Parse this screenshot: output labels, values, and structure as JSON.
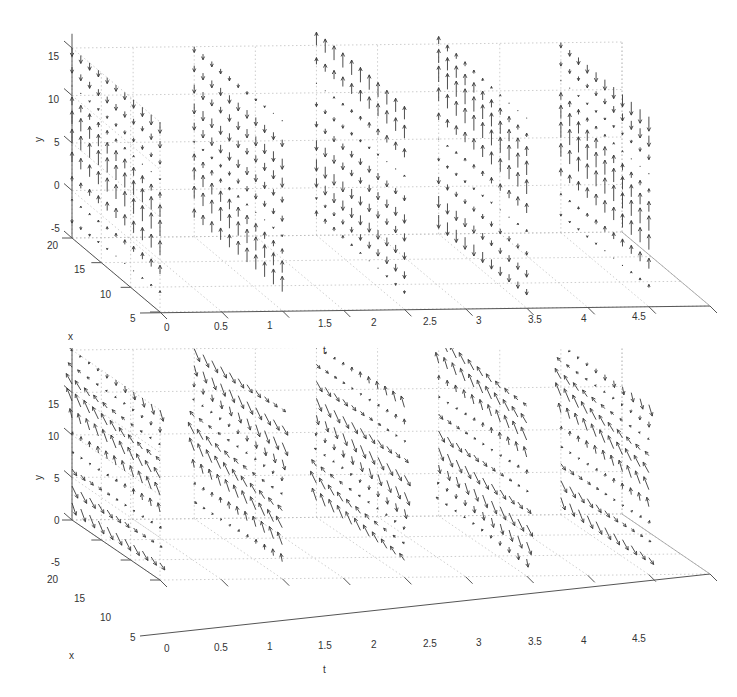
{
  "chart_data": [
    {
      "type": "quiver3d",
      "title": "",
      "panel": "top",
      "xlabel": "t",
      "ylabel": "y",
      "zlabel": "x",
      "t_ticks": [
        "0",
        "0.5",
        "1",
        "1.5",
        "2",
        "2.5",
        "3",
        "3.5",
        "4",
        "4.5"
      ],
      "y_ticks": [
        "15",
        "10",
        "5",
        "0",
        "-5"
      ],
      "x_ticks": [
        "20",
        "15",
        "10",
        "5"
      ],
      "t_range": [
        0,
        4.5
      ],
      "y_range": [
        -5,
        15
      ],
      "x_range": [
        5,
        20
      ],
      "grid": true,
      "slices_t": [
        0,
        1,
        2,
        3,
        4
      ],
      "grid_x": [
        5,
        6.5,
        8,
        9.5,
        11,
        12.5,
        14,
        15.5,
        17,
        18.5,
        20
      ],
      "grid_y": [
        -3,
        -1,
        1,
        3,
        5,
        7,
        9,
        11,
        13,
        15
      ],
      "description": "Vector field samples on 5 vertical slices; arrows vertical, predominantly upward at t=0 and progressively downward (more negative) by t=3-4, with downward region growing toward lower y and front x.",
      "phase_shift_per_slice": 0.9
    },
    {
      "type": "quiver3d",
      "title": "",
      "panel": "bottom",
      "xlabel": "t",
      "ylabel": "y",
      "zlabel": "x",
      "t_ticks": [
        "0",
        "0.5",
        "1",
        "1.5",
        "2",
        "2.5",
        "3",
        "3.5",
        "4",
        "4.5"
      ],
      "y_ticks": [
        "15",
        "10",
        "5",
        "0",
        "-5"
      ],
      "x_ticks": [
        "20",
        "15",
        "10",
        "5"
      ],
      "t_range": [
        0,
        4.5
      ],
      "y_range": [
        -5,
        15
      ],
      "x_range": [
        5,
        20
      ],
      "grid": true,
      "slices_t": [
        0,
        1,
        2,
        3,
        4
      ],
      "grid_x": [
        5,
        6.5,
        8,
        9.5,
        11,
        12.5,
        14,
        15.5,
        17,
        18.5,
        20
      ],
      "grid_y": [
        -3,
        -1,
        1,
        3,
        5,
        7,
        9,
        11,
        13,
        15
      ],
      "description": "Vector field samples on 5 vertical slices with horizontal (x) and vertical components; arrows point down-left at t=0-1, mixed at t=2, and up-right at t=3-4 in upper region.",
      "phase_shift_per_slice": 0.9
    }
  ],
  "labels": {
    "t": "t",
    "x": "x",
    "y": "y",
    "t_ticks": [
      "0",
      "0.5",
      "1",
      "1.5",
      "2",
      "2.5",
      "3",
      "3.5",
      "4",
      "4.5"
    ],
    "y_ticks": [
      "15",
      "10",
      "5",
      "0",
      "-5"
    ],
    "x_ticks": [
      "20",
      "15",
      "10",
      "5"
    ]
  },
  "colors": {
    "arrow": "#3a3a3a",
    "axis": "#555555",
    "grid": "#b8b8b8",
    "text": "#333333"
  }
}
